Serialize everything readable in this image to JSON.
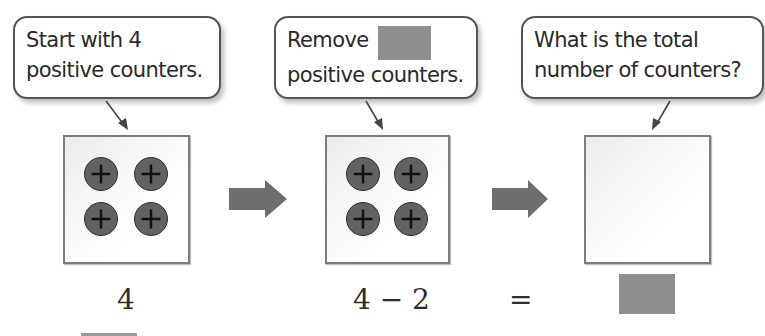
{
  "steps": [
    {
      "callout": {
        "line1": "Start with 4",
        "line2": "positive counters."
      },
      "counters": [
        "+",
        "+",
        "+",
        "+"
      ],
      "expression": "4"
    },
    {
      "callout": {
        "line1": "Remove",
        "line1_blank": true,
        "line2": "positive counters."
      },
      "counters": [
        "+",
        "+",
        "+",
        "+"
      ],
      "expression": "4 − 2"
    },
    {
      "callout": {
        "line1": "What is the total",
        "line2": "number of counters?"
      },
      "counters": [],
      "expression": "="
    }
  ],
  "result": {
    "answer_blank": true
  },
  "colors": {
    "counter_fill": "#626262",
    "counter_sign": "#111111",
    "arrow_fill": "#6e6e6e",
    "blank_fill": "#8e8e8e",
    "mat_border": "#7d7d7d"
  },
  "icons": {
    "counter": "positive-counter-icon",
    "flow": "right-arrow-icon"
  }
}
